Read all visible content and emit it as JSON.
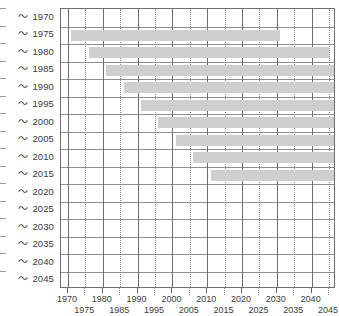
{
  "chart_data": {
    "type": "bar",
    "orientation": "horizontal",
    "subtype": "gantt-range-bar",
    "title": "",
    "subtitle": "",
    "xlabel": "",
    "ylabel": "",
    "xlim": [
      1968,
      2047
    ],
    "grid": true,
    "legend": null,
    "x_major_ticks": [
      1970,
      1980,
      1990,
      2000,
      2010,
      2020,
      2030,
      2040
    ],
    "x_minor_ticks": [
      1975,
      1985,
      1995,
      2005,
      2015,
      2025,
      2035,
      2045
    ],
    "x_major_tick_labels": [
      "1970",
      "1980",
      "1990",
      "2000",
      "2010",
      "2020",
      "2030",
      "2040"
    ],
    "x_minor_tick_labels": [
      "1975",
      "1985",
      "1995",
      "2005",
      "2015",
      "2025",
      "2035",
      "2045"
    ],
    "categories": [
      "〜 1970",
      "〜 1975",
      "〜 1980",
      "〜 1985",
      "〜 1990",
      "〜 1995",
      "〜 2000",
      "〜 2005",
      "〜 2010",
      "〜 2015",
      "〜 2020",
      "〜 2025",
      "〜 2030",
      "〜 2035",
      "〜 2040",
      "〜 2045"
    ],
    "bars": [
      {
        "category": "〜 1970",
        "start": null,
        "end": null
      },
      {
        "category": "〜 1975",
        "start": 1971,
        "end": 2031
      },
      {
        "category": "〜 1980",
        "start": 1976,
        "end": 2045
      },
      {
        "category": "〜 1985",
        "start": 1981,
        "end": 2047
      },
      {
        "category": "〜 1990",
        "start": 1986,
        "end": 2047
      },
      {
        "category": "〜 1995",
        "start": 1991,
        "end": 2047
      },
      {
        "category": "〜 2000",
        "start": 1996,
        "end": 2047
      },
      {
        "category": "〜 2005",
        "start": 2001,
        "end": 2047
      },
      {
        "category": "〜 2010",
        "start": 2006,
        "end": 2047
      },
      {
        "category": "〜 2015",
        "start": 2011,
        "end": 2047
      },
      {
        "category": "〜 2020",
        "start": null,
        "end": null
      },
      {
        "category": "〜 2025",
        "start": null,
        "end": null
      },
      {
        "category": "〜 2030",
        "start": null,
        "end": null
      },
      {
        "category": "〜 2035",
        "start": null,
        "end": null
      },
      {
        "category": "〜 2040",
        "start": null,
        "end": null
      },
      {
        "category": "〜 2045",
        "start": null,
        "end": null
      }
    ],
    "colors": {
      "bar": "#cfcfcf",
      "grid_major": "#6f6f6f",
      "grid_minor": "#8a8a8a",
      "row_line": "#8e8e8e",
      "text": "#3c3c3c",
      "background": "#ffffff"
    }
  }
}
